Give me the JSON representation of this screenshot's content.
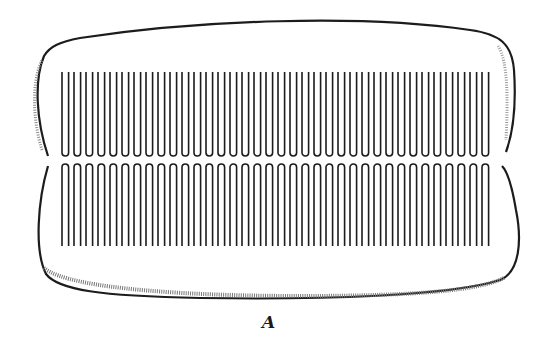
{
  "figure": {
    "caption": "A",
    "colors": {
      "ink": "#1c1c1c",
      "shade": "#6a6a6a",
      "background": "#ffffff"
    },
    "upper_row": {
      "tooth_count": 36,
      "x_start": 62,
      "x_end": 494,
      "y_top": 72,
      "y_bottom": 156
    },
    "lower_row": {
      "tooth_count": 36,
      "x_start": 62,
      "x_end": 494,
      "y_top": 164,
      "y_bottom": 246
    }
  }
}
